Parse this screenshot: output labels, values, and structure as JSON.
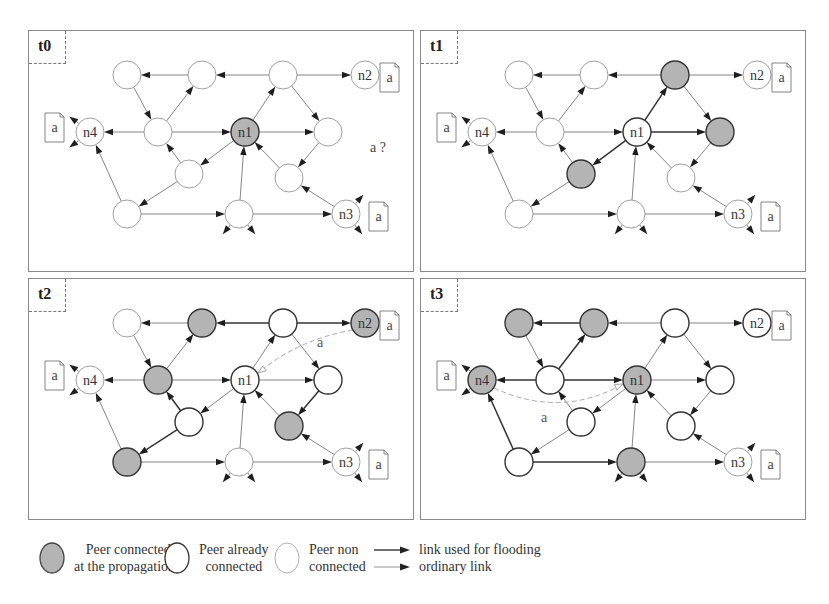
{
  "figure": {
    "panels": [
      {
        "id": "t0",
        "label": "t0",
        "query_label": "a ?",
        "gray_nodes": [
          "n1"
        ],
        "connected_nodes": [],
        "flood_edges": [],
        "answer": null
      },
      {
        "id": "t1",
        "label": "t1",
        "query_label": "",
        "gray_nodes": [
          "C",
          "E",
          "F"
        ],
        "connected_nodes": [
          "n1"
        ],
        "flood_edges": [
          [
            "n1",
            "C"
          ],
          [
            "n1",
            "E"
          ],
          [
            "n1",
            "F"
          ]
        ],
        "answer": null
      },
      {
        "id": "t2",
        "label": "t2",
        "query_label": "",
        "gray_nodes": [
          "B",
          "D",
          "G",
          "H",
          "n2"
        ],
        "connected_nodes": [
          "n1",
          "C",
          "E",
          "F"
        ],
        "flood_edges": [
          [
            "C",
            "B"
          ],
          [
            "C",
            "n2"
          ],
          [
            "E",
            "G"
          ],
          [
            "F",
            "H"
          ],
          [
            "F",
            "D"
          ]
        ],
        "answer": {
          "from": "n2",
          "to": "n1",
          "label": "a"
        }
      },
      {
        "id": "t3",
        "label": "t3",
        "query_label": "",
        "gray_nodes": [
          "A",
          "B",
          "n4",
          "n1",
          "I"
        ],
        "connected_nodes": [
          "C",
          "D",
          "E",
          "F",
          "G",
          "H",
          "n2"
        ],
        "flood_edges": [
          [
            "B",
            "A"
          ],
          [
            "D",
            "B"
          ],
          [
            "D",
            "n4"
          ],
          [
            "D",
            "n1"
          ],
          [
            "H",
            "n4"
          ],
          [
            "H",
            "I"
          ]
        ],
        "answer": {
          "from": "n4",
          "to": "n1",
          "label": "a"
        }
      }
    ],
    "node_labels": {
      "n1": "n1",
      "n2": "n2",
      "n3": "n3",
      "n4": "n4"
    },
    "document_label": "a",
    "documents_at": [
      "n2",
      "n4",
      "n3"
    ]
  },
  "legend": {
    "items": [
      {
        "kind": "gray-node",
        "line1": "Peer connected",
        "line2": "at the propagation t"
      },
      {
        "kind": "bold-node",
        "line1": "Peer already",
        "line2": "connected"
      },
      {
        "kind": "light-node",
        "line1": "Peer non",
        "line2": "connected"
      }
    ],
    "links": [
      {
        "kind": "flood",
        "label": "link used for flooding"
      },
      {
        "kind": "ordinary",
        "label": "ordinary link"
      }
    ]
  },
  "colors": {
    "gray_fill": "#b4b4b4",
    "line": "#555555",
    "border": "#8a8a8a",
    "dashed_answer": "#aaaaaa"
  }
}
